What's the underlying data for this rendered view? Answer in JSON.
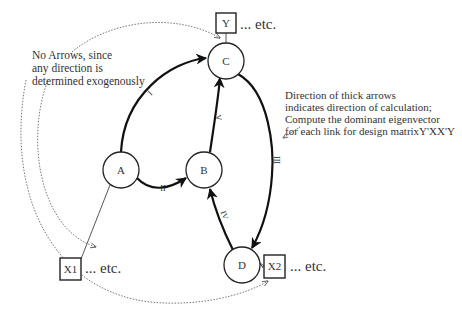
{
  "diagram": {
    "nodes": [
      {
        "id": "A",
        "label": "A"
      },
      {
        "id": "B",
        "label": "B"
      },
      {
        "id": "C",
        "label": "C"
      },
      {
        "id": "D",
        "label": "D"
      }
    ],
    "boxes": [
      {
        "id": "Y",
        "label": "Y",
        "etc": "... etc."
      },
      {
        "id": "X1",
        "label": "X1",
        "etc": "... etc."
      },
      {
        "id": "X2",
        "label": "X2",
        "etc": "... etc."
      }
    ],
    "edges": [
      {
        "from": "A",
        "to": "C",
        "label": "I",
        "style": "thick-arrow"
      },
      {
        "from": "A",
        "to": "B",
        "label": "II",
        "style": "thick-arrow"
      },
      {
        "from": "C",
        "to": "D",
        "label": "III",
        "style": "thick-arrow"
      },
      {
        "from": "D",
        "to": "B",
        "label": "IV",
        "style": "thick-arrow"
      },
      {
        "from": "B",
        "to": "C",
        "label": "V",
        "style": "thick-arrow"
      },
      {
        "from": "Y",
        "to": "C",
        "label": "",
        "style": "thin-line"
      },
      {
        "from": "X1",
        "to": "A",
        "label": "",
        "style": "thin-line"
      },
      {
        "from": "X2",
        "to": "D",
        "label": "",
        "style": "thin-line"
      }
    ],
    "annotations": {
      "left_note": [
        "No Arrows, since",
        "any direction is",
        "determined exogenously"
      ],
      "right_note": [
        "Direction of thick arrows",
        "indicates direction of calculation;",
        "Compute the dominant eigenvector",
        "for each link for design matrixY'XX'Y"
      ]
    }
  }
}
